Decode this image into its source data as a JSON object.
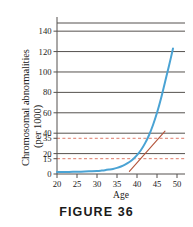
{
  "caption": "FIGURE 36",
  "colors": {
    "curve": "#4aa3d4",
    "tangent": "#b4553c",
    "gridline": "#55514e",
    "dashed_reference": "#d86a57",
    "axis": "#55514e",
    "text": "#1a1a1a",
    "background": "#ffffff"
  },
  "chart_data": {
    "type": "line",
    "title": "",
    "xlabel": "Age",
    "ylabel": "Chromosomal abnormalities (per 1000)",
    "ylabel_lines": [
      "Chromosomal abnormalities",
      "(per 1000)"
    ],
    "xlim": [
      20,
      52
    ],
    "ylim": [
      0,
      148
    ],
    "grid": true,
    "legend": "none",
    "xticks": [
      20,
      25,
      30,
      35,
      40,
      45,
      50
    ],
    "xtick_labels": [
      "20",
      "25",
      "30",
      "35",
      "40",
      "45",
      "50"
    ],
    "yticks": [
      0,
      15,
      20,
      35,
      40,
      60,
      80,
      100,
      120,
      140
    ],
    "ytick_labels": [
      "0",
      "15",
      "20",
      "35",
      "40",
      "60",
      "80",
      "100",
      "120",
      "140"
    ],
    "gridlines_solid": [
      20,
      40,
      60,
      80,
      100,
      120,
      140
    ],
    "gridlines_dashed": [
      15,
      35
    ],
    "series": [
      {
        "name": "Chromosomal abnormalities",
        "color": "#4aa3d4",
        "style": "solid",
        "x": [
          20,
          22,
          24,
          26,
          28,
          30,
          31,
          32,
          33,
          34,
          35,
          36,
          37,
          38,
          39,
          40,
          41,
          42,
          43,
          44,
          45,
          46,
          47,
          48,
          49
        ],
        "values": [
          1.9,
          2.0,
          2.1,
          2.3,
          2.6,
          3.0,
          3.3,
          3.7,
          4.3,
          5.0,
          6.0,
          7.4,
          9.2,
          11.5,
          14.5,
          18.5,
          23.5,
          30,
          38,
          48,
          60,
          74,
          90,
          106,
          123
        ]
      },
      {
        "name": "Tangent line at age 42",
        "color": "#b4553c",
        "style": "solid",
        "x": [
          38.1,
          47.0
        ],
        "values": [
          2.5,
          42.0
        ]
      }
    ]
  }
}
